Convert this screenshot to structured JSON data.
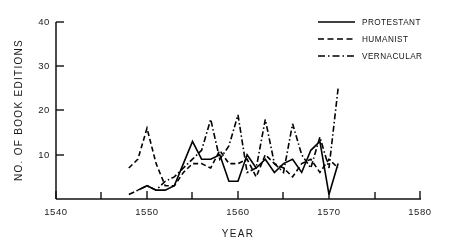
{
  "chart_data": {
    "type": "line",
    "title": "",
    "xlabel": "YEAR",
    "ylabel": "NO. OF BOOK EDITIONS",
    "xlim": [
      1540,
      1580
    ],
    "ylim": [
      0,
      40
    ],
    "grid": false,
    "legend_position": "top-right",
    "x_ticks": [
      1540,
      1545,
      1550,
      1555,
      1560,
      1565,
      1570,
      1575,
      1580
    ],
    "x_tick_labels": [
      "1540",
      "",
      "1550",
      "",
      "1560",
      "",
      "1570",
      "",
      "1580"
    ],
    "y_ticks": [
      0,
      10,
      20,
      30,
      40
    ],
    "y_tick_labels": [
      "",
      "10",
      "20",
      "30",
      "40"
    ],
    "series": [
      {
        "name": "PROTESTANT",
        "style": "solid",
        "x": [
          1549,
          1550,
          1551,
          1552,
          1553,
          1554,
          1555,
          1556,
          1557,
          1558,
          1559,
          1560,
          1561,
          1562,
          1563,
          1564,
          1565,
          1566,
          1567,
          1568,
          1569,
          1570,
          1571
        ],
        "values": [
          2,
          3,
          2,
          2,
          3,
          8,
          13,
          9,
          9,
          10,
          4,
          4,
          10,
          7,
          9,
          6,
          8,
          9,
          6,
          11,
          13,
          1,
          8
        ]
      },
      {
        "name": "HUMANIST",
        "style": "dashed",
        "x": [
          1548,
          1549,
          1550,
          1551,
          1552,
          1553,
          1554,
          1555,
          1556,
          1557,
          1558,
          1559,
          1560,
          1561,
          1562,
          1563,
          1564,
          1565,
          1566,
          1567,
          1568,
          1569,
          1570,
          1571
        ],
        "values": [
          7,
          9,
          16,
          8,
          3,
          3,
          6,
          8,
          8,
          7,
          11,
          8,
          8,
          9,
          5,
          10,
          8,
          7,
          5,
          8,
          9,
          6,
          9,
          7
        ]
      },
      {
        "name": "VERNACULAR",
        "style": "dashdot",
        "x": [
          1548,
          1549,
          1550,
          1551,
          1552,
          1553,
          1554,
          1555,
          1556,
          1557,
          1558,
          1559,
          1560,
          1561,
          1562,
          1563,
          1564,
          1565,
          1566,
          1567,
          1568,
          1569,
          1570,
          1571
        ],
        "values": [
          1,
          2,
          3,
          2,
          4,
          5,
          7,
          9,
          11,
          18,
          9,
          12,
          19,
          6,
          7,
          18,
          8,
          6,
          17,
          10,
          7,
          14,
          7,
          25
        ]
      }
    ]
  },
  "legend": {
    "items": [
      {
        "label": "PROTESTANT",
        "style": "solid"
      },
      {
        "label": "HUMANIST",
        "style": "dashed"
      },
      {
        "label": "VERNACULAR",
        "style": "dashdot"
      }
    ]
  },
  "axes": {
    "x_title": "YEAR",
    "y_title": "NO. OF BOOK EDITIONS",
    "x_labels": [
      "1540",
      "1550",
      "1560",
      "1570",
      "1580"
    ],
    "y_labels": [
      "10",
      "20",
      "30",
      "40"
    ]
  }
}
